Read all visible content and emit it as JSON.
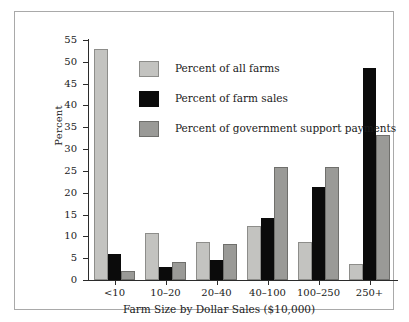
{
  "chart_data": {
    "type": "bar",
    "title": "",
    "xlabel": "Farm Size by Dollar Sales ($10,000)",
    "ylabel": "Percent",
    "categories": [
      "<10",
      "10–20",
      "20–40",
      "40–100",
      "100–250",
      "250+"
    ],
    "ylim": [
      0,
      55
    ],
    "yticks": [
      0,
      5,
      10,
      15,
      20,
      25,
      30,
      35,
      40,
      45,
      50,
      55
    ],
    "grid": false,
    "legend_position": "upper-center-inside",
    "series": [
      {
        "name": "Percent of all farms",
        "color": "#c3c3c0",
        "values": [
          53.0,
          10.8,
          8.8,
          12.4,
          8.7,
          3.7
        ]
      },
      {
        "name": "Percent of farm sales",
        "color": "#0b0b0b",
        "values": [
          5.9,
          2.9,
          4.5,
          14.1,
          21.3,
          48.6
        ]
      },
      {
        "name": "Percent of government support payments",
        "color": "#9a9a97",
        "values": [
          2.1,
          4.2,
          8.3,
          25.9,
          26.0,
          33.3
        ]
      }
    ]
  },
  "figure": {
    "background_color": "#ffffff",
    "frame_color": "#a9a9a9",
    "axis_color": "#2b2b2b"
  }
}
